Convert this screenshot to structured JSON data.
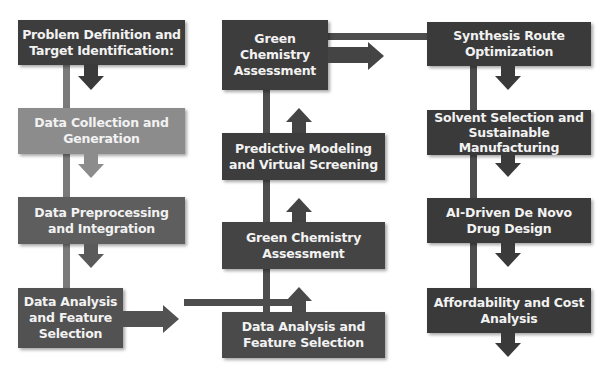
{
  "diagram": {
    "colors": {
      "dark_box": "#3d3d3d",
      "mid_box": "#5a5a5a",
      "light_box": "#8c8c8c",
      "line": "#4d4d4d",
      "background": "#ffffff"
    },
    "left_column": [
      {
        "label": "Problem Definition and Target Identification:",
        "color": "#3d3d3d"
      },
      {
        "label": "Data Collection and Generation",
        "color": "#8c8c8c"
      },
      {
        "label": "Data Preprocessing and Integration",
        "color": "#5e5e5e"
      },
      {
        "label": "Data Analysis and Feature Selection",
        "color": "#525252"
      }
    ],
    "middle_column": [
      {
        "label": "Green Chemistry Assessment",
        "color": "#3d3d3d"
      },
      {
        "label": "Predictive Modeling and Virtual Screening",
        "color": "#3d3d3d"
      },
      {
        "label": "Green Chemistry Assessment",
        "color": "#444444"
      },
      {
        "label": "Data Analysis and Feature Selection",
        "color": "#4a4a4a"
      }
    ],
    "right_column": [
      {
        "label": "Synthesis Route Optimization",
        "color": "#3a3a3a"
      },
      {
        "label": "Solvent Selection and Sustainable Manufacturing",
        "color": "#3a3a3a"
      },
      {
        "label": "AI-Driven De Novo Drug Design",
        "color": "#3a3a3a"
      },
      {
        "label": "Affordability and Cost Analysis",
        "color": "#3a3a3a"
      }
    ]
  }
}
